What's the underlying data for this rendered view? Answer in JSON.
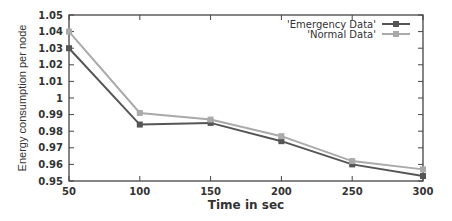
{
  "chart_data": {
    "type": "line",
    "title": "",
    "xlabel": "Time in sec",
    "ylabel": "Energy consumption per node",
    "x": [
      50,
      100,
      150,
      200,
      250,
      300
    ],
    "xticks": [
      "50",
      "100",
      "150",
      "200",
      "250",
      "300"
    ],
    "yticks": [
      "0.95",
      "0.96",
      "0.97",
      "0.98",
      "0.99",
      "1",
      "1.01",
      "1.02",
      "1.03",
      "1.04",
      "1.05"
    ],
    "xlim": [
      50,
      300
    ],
    "ylim": [
      0.95,
      1.05
    ],
    "grid": false,
    "legend_position": "top-right",
    "series": [
      {
        "name": "'Emergency Data'",
        "color": "#555555",
        "marker": "square",
        "values": [
          1.03,
          0.984,
          0.985,
          0.974,
          0.96,
          0.953
        ]
      },
      {
        "name": "'Normal Data'",
        "color": "#aaaaaa",
        "marker": "square",
        "values": [
          1.04,
          0.991,
          0.987,
          0.977,
          0.962,
          0.957
        ]
      }
    ]
  }
}
